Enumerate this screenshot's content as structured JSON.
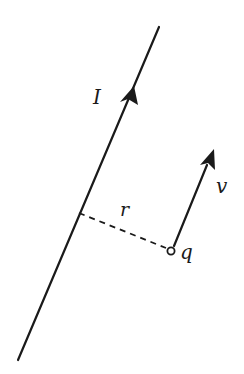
{
  "diagram": {
    "colors": {
      "ink": "#1a1a1a",
      "background": "#ffffff"
    },
    "wire": {
      "label": "I",
      "start": [
        18,
        360
      ],
      "end": [
        159,
        27
      ],
      "arrow_tip": [
        133,
        88
      ]
    },
    "charge": {
      "label": "q",
      "position": [
        171,
        251
      ]
    },
    "velocity": {
      "label": "v",
      "start": [
        174,
        245
      ],
      "tip": [
        213,
        151
      ]
    },
    "distance": {
      "label": "r",
      "start": [
        79,
        213
      ],
      "end": [
        167,
        249
      ],
      "style": "dashed"
    }
  }
}
